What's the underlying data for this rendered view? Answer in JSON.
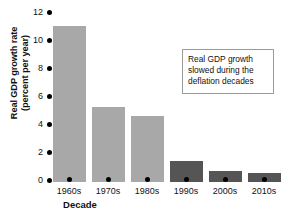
{
  "chart_data": {
    "type": "bar",
    "title": "",
    "categories": [
      "1960s",
      "1970s",
      "1980s",
      "1990s",
      "2000s",
      "2010s"
    ],
    "values": [
      10.9,
      5.2,
      4.6,
      1.5,
      0.8,
      0.6
    ],
    "xlabel": "Decade",
    "ylabel": "Real GDP growth rate (percent per year)",
    "ylabel_lines": [
      "Real GDP growth rate",
      "(percent per year)"
    ],
    "ylim": [
      0,
      12
    ],
    "ytick_values": [
      12,
      10,
      8,
      6,
      4,
      2,
      0
    ],
    "ytick_labels": [
      "12",
      "10",
      "8",
      "6",
      "4",
      "2",
      "0"
    ],
    "grid": false,
    "legend": null,
    "bar_colors": [
      "#a8a8a8",
      "#a8a8a8",
      "#a8a8a8",
      "#555555",
      "#555555",
      "#555555"
    ],
    "annotations": [
      {
        "lines": [
          "Real GDP growth",
          "slowed during the",
          "deflation decades"
        ],
        "text": "Real GDP growth slowed during the deflation decades",
        "position": "top-right",
        "border_color": "#9a9a9a",
        "background_color": "#ffffff"
      }
    ],
    "colors": {
      "light_bar": "#a8a8a8",
      "dark_bar": "#555555",
      "axis_marker": "#000000",
      "text": "#111111",
      "background": "#ffffff"
    }
  }
}
